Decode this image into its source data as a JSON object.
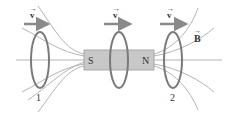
{
  "diagram": {
    "magnet": {
      "south_label": "S",
      "north_label": "N",
      "fill": "#c8c8c8",
      "stroke": "#9a9a9a"
    },
    "velocity_label": "v",
    "field_label": "B",
    "ring_labels": [
      "1",
      "2"
    ],
    "colors": {
      "ring": "#7a7a7a",
      "ring_fill": "#b0b0b0",
      "field_line": "#b4b4b4",
      "arrow": "#8a8a8a",
      "text": "#333333"
    }
  }
}
